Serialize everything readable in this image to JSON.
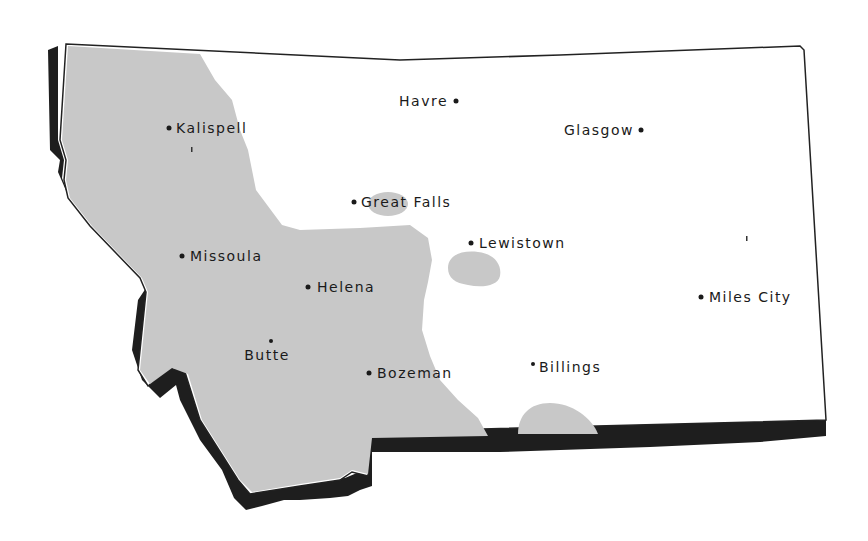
{
  "map": {
    "region": "Montana",
    "colors": {
      "background": "#ffffff",
      "shaded_region": "#c8c8c8",
      "shadow": "#1e1e1e",
      "outline": "#222222",
      "text": "#1a1a1a"
    },
    "cities": [
      {
        "name": "Havre",
        "label": "Havre",
        "x": 456,
        "y": 101,
        "label_side": "left"
      },
      {
        "name": "Glasgow",
        "label": "Glasgow",
        "x": 641,
        "y": 130,
        "label_side": "left"
      },
      {
        "name": "Kalispell",
        "label": "Kalispell",
        "x": 169,
        "y": 128,
        "label_side": "right"
      },
      {
        "name": "Great Falls",
        "label": "Great Falls",
        "x": 354,
        "y": 202,
        "label_side": "right"
      },
      {
        "name": "Lewistown",
        "label": "Lewistown",
        "x": 471,
        "y": 243,
        "label_side": "right"
      },
      {
        "name": "Missoula",
        "label": "Missoula",
        "x": 182,
        "y": 256,
        "label_side": "right"
      },
      {
        "name": "Helena",
        "label": "Helena",
        "x": 308,
        "y": 287,
        "label_side": "right"
      },
      {
        "name": "Miles City",
        "label": "Miles City",
        "x": 701,
        "y": 297,
        "label_side": "right"
      },
      {
        "name": "Butte",
        "label": "Butte",
        "x": 271,
        "y": 341,
        "label_side": "below"
      },
      {
        "name": "Bozeman",
        "label": "Bozeman",
        "x": 369,
        "y": 373,
        "label_side": "right"
      },
      {
        "name": "Billings",
        "label": "Billings",
        "x": 533,
        "y": 364,
        "label_side": "right"
      }
    ]
  }
}
